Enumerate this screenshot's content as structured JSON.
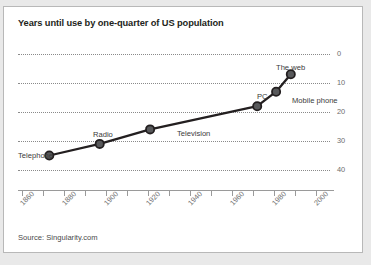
{
  "card": {
    "title": "Years until use by one-quarter of US population",
    "source": "Source: Singularity.com",
    "border_color": "#b8b8b8",
    "background_color": "#ffffff",
    "page_background": "#e9e9e9"
  },
  "chart_data": {
    "type": "line",
    "title": "Years until use by one-quarter of US population",
    "xlabel": "",
    "ylabel": "",
    "xlim": [
      1855,
      2005
    ],
    "ylim": [
      0,
      44
    ],
    "y_axis_inverted": true,
    "y_axis_position": "right",
    "grid": true,
    "grid_style": "dotted-horizontal",
    "legend": "none",
    "line_color": "#231f20",
    "marker_color": "#58595b",
    "marker_edge_color": "#231f20",
    "xticks": [
      1860,
      1870,
      1880,
      1890,
      1900,
      1910,
      1920,
      1930,
      1940,
      1950,
      1960,
      1970,
      1980,
      1990,
      2000
    ],
    "xtick_labels": [
      "1860",
      "",
      "1880",
      "",
      "1900",
      "",
      "1920",
      "",
      "1940",
      "",
      "1960",
      "",
      "1980",
      "",
      "2000"
    ],
    "xtick_labels_shown": [
      "1860",
      "1880",
      "1900",
      "1920",
      "1940",
      "1960",
      "1980",
      "2000"
    ],
    "yticks": [
      0,
      10,
      20,
      30,
      40
    ],
    "ytick_labels": [
      "0",
      "10",
      "20",
      "30",
      "40"
    ],
    "points": [
      {
        "name": "Telephone",
        "x": 1873,
        "y": 35,
        "label_side": "left"
      },
      {
        "name": "Radio",
        "x": 1897,
        "y": 31,
        "label_side": "above"
      },
      {
        "name": "Television",
        "x": 1921,
        "y": 26,
        "label_side": "right"
      },
      {
        "name": "PC",
        "x": 1972,
        "y": 18,
        "label_side": "above-left"
      },
      {
        "name": "Mobile phone",
        "x": 1981,
        "y": 13,
        "label_side": "below-right"
      },
      {
        "name": "The web",
        "x": 1988,
        "y": 7,
        "label_side": "above-left"
      }
    ],
    "series": [
      {
        "name": "Years until use by one-quarter of US population",
        "x": [
          1873,
          1897,
          1921,
          1972,
          1981,
          1988
        ],
        "values": [
          35,
          31,
          26,
          18,
          13,
          7
        ]
      }
    ],
    "categories": [
      "Telephone",
      "Radio",
      "Television",
      "PC",
      "Mobile phone",
      "The web"
    ]
  }
}
